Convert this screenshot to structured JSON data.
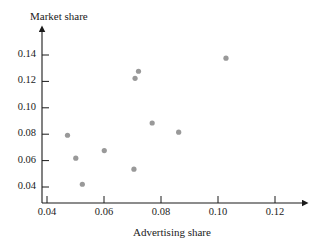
{
  "figure": {
    "top_cut_text": "",
    "point_color": "#999999",
    "axis_color": "#1a1a1a"
  },
  "chart_data": {
    "type": "scatter",
    "title": "",
    "xlabel": "Advertising share",
    "ylabel": "Market share",
    "xlim": [
      0.033,
      0.132
    ],
    "ylim": [
      0.029,
      0.152
    ],
    "xticks": [
      0.04,
      0.06,
      0.08,
      0.1,
      0.12
    ],
    "xtick_labels": [
      "0.04",
      "0.06",
      "0.08",
      "0.10",
      "0.12"
    ],
    "yticks": [
      0.04,
      0.06,
      0.08,
      0.1,
      0.12,
      0.14
    ],
    "ytick_labels": [
      "0.04",
      "0.06",
      "0.08",
      "0.10",
      "0.12",
      "0.14"
    ],
    "grid": false,
    "legend": null,
    "points": [
      {
        "x": 0.0472,
        "y": 0.0792
      },
      {
        "x": 0.0501,
        "y": 0.0618
      },
      {
        "x": 0.0524,
        "y": 0.0421
      },
      {
        "x": 0.0601,
        "y": 0.0676
      },
      {
        "x": 0.0705,
        "y": 0.0535
      },
      {
        "x": 0.0709,
        "y": 0.1223
      },
      {
        "x": 0.0721,
        "y": 0.1277
      },
      {
        "x": 0.0769,
        "y": 0.0885
      },
      {
        "x": 0.0862,
        "y": 0.0815
      },
      {
        "x": 0.1028,
        "y": 0.1376
      }
    ]
  }
}
